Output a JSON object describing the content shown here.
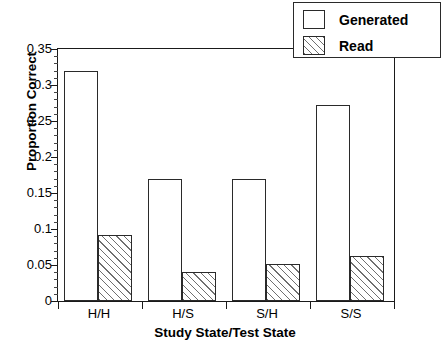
{
  "chart_data": {
    "type": "bar",
    "title": "",
    "xlabel": "Study State/Test State",
    "ylabel": "Proportion Correct",
    "categories": [
      "H/H",
      "H/S",
      "S/H",
      "S/S"
    ],
    "series": [
      {
        "name": "Generated",
        "values": [
          0.32,
          0.17,
          0.17,
          0.272
        ],
        "fill": "white",
        "pattern": "none"
      },
      {
        "name": "Read",
        "values": [
          0.092,
          0.04,
          0.052,
          0.062
        ],
        "fill": "white",
        "pattern": "diagonal-hatch"
      }
    ],
    "ylim": [
      0,
      0.35
    ],
    "ytick_labels": [
      "0",
      "0.05",
      "0.1",
      "0.15",
      "0.2",
      "0.25",
      "0.3",
      "0.35"
    ],
    "ytick_values": [
      0,
      0.05,
      0.1,
      0.15,
      0.2,
      0.25,
      0.3,
      0.35
    ],
    "yminor_interval": 0.01,
    "grid": false,
    "legend_position": "top-right",
    "legend_entries": [
      "Generated",
      "Read"
    ],
    "axis_color": "#1a1a1a",
    "bar_edge_color": "#2a2a2a",
    "hatch_color": "#6f6f6f",
    "background": "#ffffff"
  },
  "legend": {
    "entries": [
      {
        "label": "Generated",
        "swatch": "empty-box-swatch"
      },
      {
        "label": "Read",
        "swatch": "hatched-box-swatch"
      }
    ]
  },
  "axes": {
    "y_title": "Proportion Correct",
    "x_title": "Study State/Test State"
  }
}
